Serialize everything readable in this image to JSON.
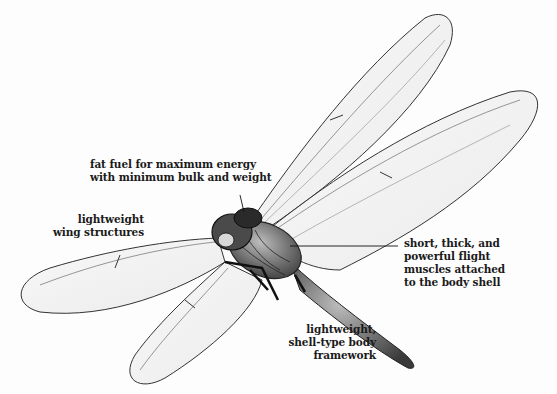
{
  "diagram": {
    "colors": {
      "ink": "#1a1a1a",
      "background": "#fdfdfd",
      "wing_fill": "#ececec"
    },
    "labels": [
      {
        "id": "fat-fuel",
        "lines": [
          "fat fuel for maximum energy",
          "with minimum bulk and weight"
        ]
      },
      {
        "id": "wing-structures",
        "lines": [
          "lightweight",
          "wing structures"
        ]
      },
      {
        "id": "flight-muscles",
        "lines": [
          "short, thick, and",
          "powerful flight",
          "muscles attached",
          "to the body shell"
        ]
      },
      {
        "id": "body-framework",
        "lines": [
          "lightweight,",
          "shell-type body",
          "framework"
        ]
      }
    ]
  }
}
